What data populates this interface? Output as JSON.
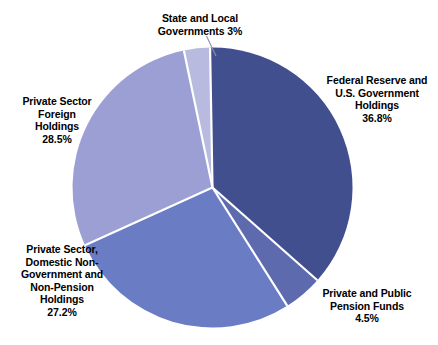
{
  "chart_data": {
    "type": "pie",
    "title": "",
    "subtitle": "",
    "xlabel": "",
    "ylabel": "",
    "legend_position": "none",
    "grid": false,
    "units": "percent",
    "start_angle_deg": -1,
    "direction": "clockwise",
    "categories": [
      "Federal Reserve and U.S. Government Holdings",
      "Private and Public Pension Funds",
      "Private Sector, Domestic Non-Government and Non-Pension Holdings",
      "Private Sector Foreign Holdings",
      "State and Local Governments"
    ],
    "values": [
      36.8,
      4.5,
      27.2,
      28.5,
      3
    ],
    "value_labels": [
      "36.8%",
      "4.5%",
      "27.2%",
      "28.5%",
      "3%"
    ],
    "colors": [
      "#414f8f",
      "#5d6aae",
      "#6a7cc4",
      "#9c9fd4",
      "#b8bad f"
    ],
    "slices": [
      {
        "name": "federal-reserve",
        "label_lines": "Federal Reserve and\nU.S. Government\nHoldings\n36.8%",
        "value": 36.8,
        "value_label": "36.8%",
        "color": "#414f8f",
        "start_deg": -1,
        "sweep_deg": 132.5
      },
      {
        "name": "pension-funds",
        "label_lines": "Private and Public\nPension Funds\n4.5%",
        "value": 4.5,
        "value_label": "4.5%",
        "color": "#5d6aae",
        "start_deg": 131.5,
        "sweep_deg": 16.2
      },
      {
        "name": "domestic-holdings",
        "label_lines": "Private Sector,\nDomestic Non-\nGovernment and\nNon-Pension\nHoldings\n27.2%",
        "value": 27.2,
        "value_label": "27.2%",
        "color": "#6a7cc4",
        "start_deg": 147.7,
        "sweep_deg": 97.9
      },
      {
        "name": "foreign-holdings",
        "label_lines": "Private Sector\nForeign\nHoldings\n28.5%",
        "value": 28.5,
        "value_label": "28.5%",
        "color": "#9c9fd4",
        "start_deg": 245.6,
        "sweep_deg": 102.6
      },
      {
        "name": "state-local",
        "label_lines": "State and Local\nGovernments 3%",
        "value": 3,
        "value_label": "3%",
        "color": "#b8badf",
        "start_deg": 348.2,
        "sweep_deg": 10.8
      }
    ]
  },
  "labels": {
    "state_local": "State and Local\nGovernments 3%",
    "federal_reserve": "Federal Reserve and\nU.S. Government\nHoldings\n36.8%",
    "foreign_holdings": "Private Sector\nForeign\nHoldings\n28.5%",
    "domestic_holdings": "Private Sector,\nDomestic Non-\nGovernment and\nNon-Pension\nHoldings\n27.2%",
    "pension_funds": "Private and Public\nPension Funds\n4.5%"
  },
  "style": {
    "background": "#ffffff",
    "separator_color": "#ffffff",
    "text_color": "#000000",
    "leader_line_color": "#8d8fa8"
  }
}
